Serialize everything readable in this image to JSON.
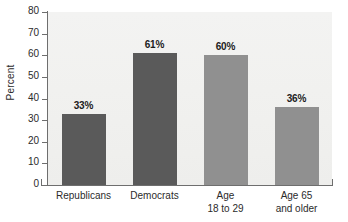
{
  "chart_data": {
    "type": "bar",
    "title": "",
    "xlabel": "",
    "ylabel": "Percent",
    "ylim": [
      0,
      80
    ],
    "ytick_step": 10,
    "grid": false,
    "legend": "none",
    "categories": [
      "Republicans",
      "Democrats",
      "Age 18 to 29",
      "Age 65 and older"
    ],
    "values": [
      33,
      61,
      60,
      36
    ],
    "value_labels": [
      "33%",
      "61%",
      "60%",
      "36%"
    ],
    "ytick_labels": [
      "80",
      "70",
      "60",
      "50",
      "40",
      "30",
      "20",
      "10",
      "0"
    ],
    "bar_colors": [
      "#5a5a5a",
      "#5a5a5a",
      "#909090",
      "#909090"
    ],
    "plot_background": "#f1f1ef",
    "axis_color": "#6e6e6e"
  },
  "axis": {
    "y_title": "Percent"
  },
  "x_labels": [
    {
      "line1": "Republicans",
      "line2": ""
    },
    {
      "line1": "Democrats",
      "line2": ""
    },
    {
      "line1": "Age",
      "line2": "18 to 29"
    },
    {
      "line1": "Age 65",
      "line2": "and older"
    }
  ]
}
